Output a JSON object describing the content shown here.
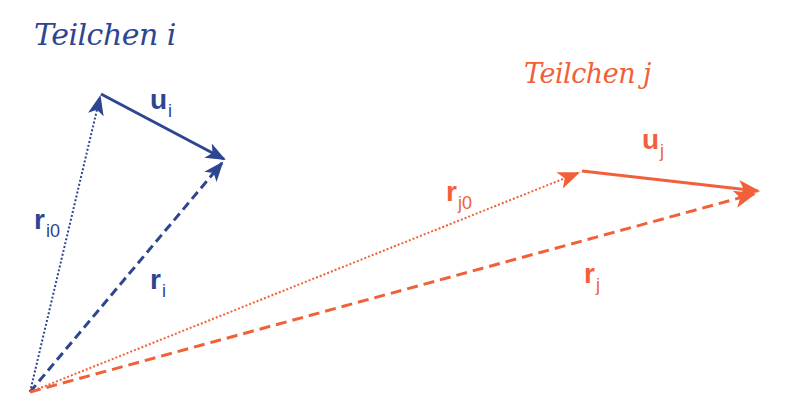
{
  "colors": {
    "particle_i": "#2e4591",
    "particle_j": "#f2603a",
    "background": "#ffffff"
  },
  "particle_i": {
    "title": "Teilchen i",
    "vectors": {
      "u": {
        "base": "u",
        "sub": "i"
      },
      "r0": {
        "base": "r",
        "sub": "i0"
      },
      "r": {
        "base": "r",
        "sub": "i"
      }
    }
  },
  "particle_j": {
    "title": "Teilchen j",
    "vectors": {
      "u": {
        "base": "u",
        "sub": "j"
      },
      "r0": {
        "base": "r",
        "sub": "j0"
      },
      "r": {
        "base": "r",
        "sub": "j"
      }
    }
  }
}
